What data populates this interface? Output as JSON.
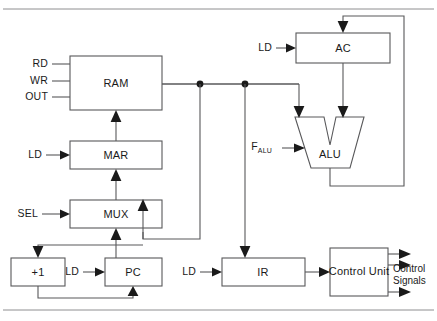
{
  "diagram": {
    "blocks": {
      "ram": {
        "label": "RAM"
      },
      "mar": {
        "label": "MAR"
      },
      "mux": {
        "label": "MUX"
      },
      "inc": {
        "label": "+1"
      },
      "pc": {
        "label": "PC"
      },
      "ir": {
        "label": "IR"
      },
      "ac": {
        "label": "AC"
      },
      "alu": {
        "label": "ALU"
      },
      "control_unit": {
        "label": "Control Unit"
      }
    },
    "signals": {
      "ram_rd": "RD",
      "ram_wr": "WR",
      "ram_out": "OUT",
      "mar_ld": "LD",
      "mux_sel": "SEL",
      "pc_ld": "LD",
      "ir_ld": "LD",
      "ac_ld": "LD",
      "alu_f": "F",
      "alu_f_sub": "ALU"
    },
    "outputs": {
      "control_signals_line1": "Control",
      "control_signals_line2": "Signals"
    },
    "colors": {
      "stroke": "#58585a",
      "ink": "#1a1a1a",
      "background": "#ffffff"
    }
  }
}
